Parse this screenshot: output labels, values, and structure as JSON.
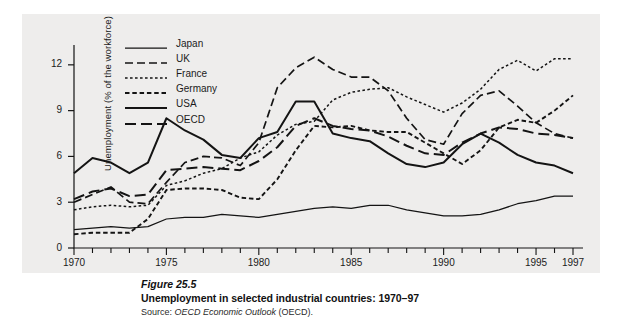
{
  "figure": {
    "number_label": "Figure 25.5",
    "title": "Unemployment in selected industrial countries: 1970–97",
    "source_prefix": "Source: ",
    "source_italic": "OECD Economic Outlook",
    "source_suffix": " (OECD)."
  },
  "chart_data": {
    "type": "line",
    "title": "Unemployment in selected industrial countries: 1970–97",
    "xlabel": "",
    "ylabel": "Unemployment (% of the workforce)",
    "xlim": [
      1970,
      1997
    ],
    "ylim": [
      0,
      13.3
    ],
    "yticks": [
      0,
      3,
      6,
      9,
      12
    ],
    "ytick_labels": [
      "0",
      "3",
      "6",
      "9",
      "12"
    ],
    "xticks": [
      1970,
      1975,
      1980,
      1985,
      1990,
      1995,
      1997
    ],
    "xtick_labels": [
      "1970",
      "1975",
      "1980",
      "1985",
      "1990",
      "1995",
      "1997"
    ],
    "minor_xticks_every": 1,
    "grid": false,
    "legend_position": "upper-left-inside",
    "x": [
      1970,
      1971,
      1972,
      1973,
      1974,
      1975,
      1976,
      1977,
      1978,
      1979,
      1980,
      1981,
      1982,
      1983,
      1984,
      1985,
      1986,
      1987,
      1988,
      1989,
      1990,
      1991,
      1992,
      1993,
      1994,
      1995,
      1996,
      1997
    ],
    "series": [
      {
        "name": "Japan",
        "style": "solid-thin",
        "color": "#141414",
        "values": [
          1.2,
          1.3,
          1.4,
          1.3,
          1.4,
          1.9,
          2.0,
          2.0,
          2.2,
          2.1,
          2.0,
          2.2,
          2.4,
          2.6,
          2.7,
          2.6,
          2.8,
          2.8,
          2.5,
          2.3,
          2.1,
          2.1,
          2.2,
          2.5,
          2.9,
          3.1,
          3.4,
          3.4
        ]
      },
      {
        "name": "UK",
        "style": "dashed",
        "color": "#141414",
        "values": [
          3.0,
          3.5,
          4.0,
          3.0,
          2.9,
          4.3,
          5.6,
          6.0,
          5.9,
          5.4,
          6.9,
          10.5,
          11.8,
          12.5,
          11.7,
          11.2,
          11.2,
          10.3,
          8.5,
          7.1,
          6.8,
          8.8,
          10.0,
          10.3,
          9.3,
          8.2,
          7.5,
          7.2
        ]
      },
      {
        "name": "France",
        "style": "dotted-fine",
        "color": "#141414",
        "values": [
          2.5,
          2.7,
          2.8,
          2.7,
          2.8,
          4.1,
          4.4,
          4.9,
          5.2,
          5.9,
          6.3,
          7.4,
          8.1,
          8.3,
          9.7,
          10.2,
          10.4,
          10.5,
          9.9,
          9.4,
          8.9,
          9.5,
          10.4,
          11.7,
          12.3,
          11.6,
          12.4,
          12.4
        ]
      },
      {
        "name": "Germany",
        "style": "dotted",
        "color": "#141414",
        "values": [
          0.9,
          1.0,
          1.0,
          1.0,
          1.9,
          3.8,
          3.9,
          3.9,
          3.8,
          3.3,
          3.2,
          4.5,
          6.4,
          8.0,
          7.9,
          8.0,
          7.7,
          7.6,
          7.6,
          6.9,
          6.2,
          5.5,
          6.4,
          7.9,
          8.4,
          8.2,
          9.0,
          10.0
        ]
      },
      {
        "name": "USA",
        "style": "solid-thick",
        "color": "#141414",
        "values": [
          4.9,
          5.9,
          5.6,
          4.9,
          5.6,
          8.5,
          7.7,
          7.1,
          6.1,
          5.9,
          7.2,
          7.6,
          9.6,
          9.6,
          7.5,
          7.2,
          7.0,
          6.2,
          5.5,
          5.3,
          5.6,
          6.8,
          7.5,
          6.9,
          6.1,
          5.6,
          5.4,
          4.9
        ]
      },
      {
        "name": "OECD",
        "style": "dashed-long",
        "color": "#141414",
        "values": [
          3.2,
          3.7,
          3.9,
          3.4,
          3.5,
          5.1,
          5.2,
          5.3,
          5.2,
          5.1,
          5.7,
          6.6,
          8.0,
          8.5,
          8.0,
          7.8,
          7.7,
          7.3,
          6.7,
          6.2,
          6.1,
          6.9,
          7.5,
          7.9,
          7.8,
          7.5,
          7.4,
          7.2
        ]
      }
    ]
  },
  "legend": {
    "items": [
      {
        "label": "Japan",
        "style": "solid-thin"
      },
      {
        "label": "UK",
        "style": "dashed"
      },
      {
        "label": "France",
        "style": "dotted-fine"
      },
      {
        "label": "Germany",
        "style": "dotted"
      },
      {
        "label": "USA",
        "style": "solid-thick"
      },
      {
        "label": "OECD",
        "style": "dashed-long"
      }
    ]
  },
  "axes": {
    "y_label": "Unemployment (% of the workforce)",
    "y_tick_labels": [
      "0",
      "3",
      "6",
      "9",
      "12"
    ],
    "x_tick_labels": [
      "1970",
      "1975",
      "1980",
      "1985",
      "1990",
      "1995",
      "1997"
    ]
  },
  "colors": {
    "panel_background": "#eeedec",
    "page_background": "#ffffff",
    "ink": "#141414"
  }
}
